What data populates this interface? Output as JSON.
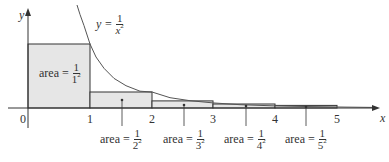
{
  "figure": {
    "axes": {
      "x_label": "x",
      "y_label": "y",
      "origin_label": "0",
      "x_ticks": [
        "1",
        "2",
        "3",
        "4",
        "5"
      ]
    },
    "curve": {
      "equation_lhs": "y =",
      "numerator": "1",
      "denominator_base": "x",
      "denominator_exp": "2"
    },
    "rectangles": [
      {
        "prefix": "area =",
        "numerator": "1",
        "base": "1",
        "exp": "2",
        "height": 1
      },
      {
        "prefix": "area =",
        "numerator": "1",
        "base": "2",
        "exp": "2",
        "height": 0.25
      },
      {
        "prefix": "area =",
        "numerator": "1",
        "base": "3",
        "exp": "2",
        "height": 0.1111
      },
      {
        "prefix": "area =",
        "numerator": "1",
        "base": "4",
        "exp": "2",
        "height": 0.0625
      },
      {
        "prefix": "area =",
        "numerator": "1",
        "base": "5",
        "exp": "2",
        "height": 0.04
      }
    ],
    "colors": {
      "fill": "#e6e6e6",
      "stroke": "#333333",
      "curve": "#555555"
    }
  }
}
